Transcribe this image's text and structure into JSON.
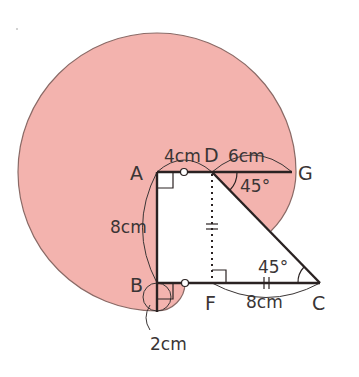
{
  "figure": {
    "type": "geometry-diagram",
    "colors": {
      "shade": "#f3b3ae",
      "outline": "#8a6a66",
      "line": "#2a2222",
      "text": "#3a3535"
    },
    "points": {
      "A": "A",
      "B": "B",
      "C": "C",
      "D": "D",
      "F": "F",
      "G": "G"
    },
    "measurements": {
      "AD": "4cm",
      "DG": "6cm",
      "AB": "8cm",
      "FC": "8cm",
      "B_radius": "2cm"
    },
    "angles": {
      "GDC": "45°",
      "DCB": "45°"
    }
  }
}
